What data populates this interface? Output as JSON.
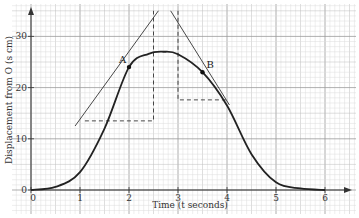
{
  "chart_data": {
    "type": "line",
    "title": "",
    "xlabel": "Time (t seconds)",
    "ylabel": "Displacement from O (s cm)",
    "xlim": [
      0,
      6.5
    ],
    "ylim": [
      0,
      35
    ],
    "grid": true,
    "x_ticks": [
      "0",
      "1",
      "2",
      "3",
      "4",
      "5",
      "6"
    ],
    "y_ticks": [
      "0",
      "10",
      "20",
      "30"
    ],
    "series": [
      {
        "name": "s(t)",
        "x": [
          0,
          0.5,
          1,
          1.5,
          2,
          2.4,
          2.7,
          3,
          3.5,
          4,
          4.5,
          5,
          5.5,
          6
        ],
        "y": [
          0,
          0.6,
          3.5,
          12,
          24,
          26.6,
          27,
          26.5,
          23,
          16.5,
          7,
          1.5,
          0.3,
          0
        ]
      }
    ],
    "annotations": [
      {
        "label": "A",
        "x": 2,
        "y": 24,
        "type": "point"
      },
      {
        "label": "B",
        "x": 3.5,
        "y": 23,
        "type": "point"
      },
      {
        "type": "tangent",
        "at": "A",
        "from": [
          0.9,
          12.5
        ],
        "to": [
          2.6,
          35
        ]
      },
      {
        "type": "tangent",
        "at": "B",
        "from": [
          2.85,
          35
        ],
        "to": [
          4.05,
          16.6
        ]
      },
      {
        "type": "dashed",
        "points": [
          [
            1.1,
            13.5
          ],
          [
            2.5,
            13.5
          ],
          [
            2.5,
            35
          ]
        ]
      },
      {
        "type": "dashed",
        "points": [
          [
            3.0,
            35
          ],
          [
            3.0,
            17.6
          ],
          [
            4.0,
            17.6
          ]
        ]
      }
    ]
  },
  "labels": {
    "x_axis": "Time (t seconds)",
    "y_axis": "Displacement from O (s cm)",
    "point_a": "A",
    "point_b": "B",
    "origin_x": "0",
    "origin_y": "0"
  }
}
